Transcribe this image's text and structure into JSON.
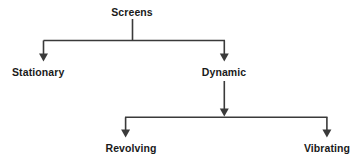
{
  "diagram": {
    "type": "hierarchy-tree",
    "background_color": "#ffffff",
    "line_color": "#3a3a3a",
    "text_color": "#1a1a1a",
    "nodes": [
      {
        "id": "screens",
        "label": "Screens",
        "level": 0,
        "x": 132,
        "y": 12
      },
      {
        "id": "stationary",
        "label": "Stationary",
        "level": 1,
        "x": 44,
        "y": 72
      },
      {
        "id": "dynamic",
        "label": "Dynamic",
        "level": 1,
        "x": 224,
        "y": 72
      },
      {
        "id": "revolving",
        "label": "Revolving",
        "level": 2,
        "x": 131,
        "y": 148
      },
      {
        "id": "vibrating",
        "label": "Vibrating",
        "level": 2,
        "x": 327,
        "y": 148
      }
    ],
    "edges": [
      {
        "from": "screens",
        "to": "stationary",
        "arrow": true
      },
      {
        "from": "screens",
        "to": "dynamic",
        "arrow": true
      },
      {
        "from": "dynamic",
        "to": "revolving",
        "arrow": true
      },
      {
        "from": "dynamic",
        "to": "vibrating",
        "arrow": true
      }
    ]
  }
}
